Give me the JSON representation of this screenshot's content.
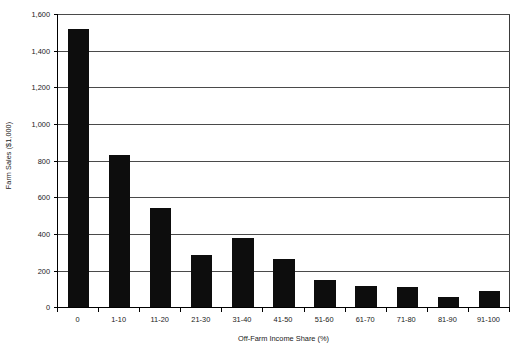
{
  "chart_data": {
    "type": "bar",
    "title": "",
    "xlabel": "Off-Farm Income Share (%)",
    "ylabel": "Farm Sales ($1,000)",
    "categories": [
      "0",
      "1-10",
      "11-20",
      "21-30",
      "31-40",
      "41-50",
      "51-60",
      "61-70",
      "71-80",
      "81-90",
      "91-100"
    ],
    "values": [
      1520,
      830,
      540,
      285,
      380,
      265,
      150,
      115,
      110,
      55,
      90
    ],
    "ylim": [
      0,
      1600
    ],
    "ytick_values": [
      0,
      200,
      400,
      600,
      800,
      1000,
      1200,
      1400,
      1600
    ],
    "ytick_labels": [
      "0",
      "200",
      "400",
      "600",
      "800",
      "1,000",
      "1,200",
      "1,400",
      "1,600"
    ],
    "grid": true,
    "legend": "none",
    "bar_color": "#0d0d0d",
    "gridline_color": "#4a4a4a",
    "axis_color": "#000000",
    "background_color": "#ffffff"
  }
}
